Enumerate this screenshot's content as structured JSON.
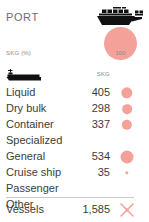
{
  "header": {
    "title": "PORT",
    "unit_label": "SKG (%)",
    "ship_icon": "cargo-ship-icon",
    "legend": {
      "value": "100",
      "bubble_color": "#f4a19a"
    }
  },
  "table": {
    "columns": {
      "category_icon": "tanker-boat-icon",
      "value_header": "SKG"
    },
    "rows": [
      {
        "label": "Liquid",
        "value": "405",
        "magnitude": 405
      },
      {
        "label": "Dry bulk",
        "value": "298",
        "magnitude": 298
      },
      {
        "label": "Container",
        "value": "337",
        "magnitude": 337
      },
      {
        "label": "Specialized",
        "value": "",
        "magnitude": 0
      },
      {
        "label": "General",
        "value": "534",
        "magnitude": 534
      },
      {
        "label": "Cruise ship",
        "value": "35",
        "magnitude": 35
      },
      {
        "label": "Passenger",
        "value": "",
        "magnitude": 0
      },
      {
        "label": "Other",
        "value": "",
        "magnitude": 0
      }
    ],
    "total": {
      "label": "Vessels",
      "value": "1,585",
      "mark": "x-mark-icon"
    }
  },
  "chart_data": {
    "type": "bar",
    "title": "PORT",
    "subtitle": "SKG (%)",
    "xlabel": "",
    "ylabel": "SKG",
    "categories": [
      "Liquid",
      "Dry bulk",
      "Container",
      "Specialized",
      "General",
      "Cruise ship",
      "Passenger",
      "Other"
    ],
    "values": [
      405,
      298,
      337,
      null,
      534,
      35,
      null,
      null
    ],
    "legend": [
      "100"
    ],
    "legend_position": "top-right",
    "grid": false,
    "annotations": [
      "Vessels 1,585"
    ],
    "encoding": "bubble-size proportional to SKG value",
    "accent_color": "#f4a19a",
    "total": 1585
  },
  "colors": {
    "accent": "#f4a19a",
    "text": "#3b3b3b",
    "muted": "#8a8a8a",
    "divider": "#c9c9c9",
    "icon": "#1a1a1a",
    "background": "#ffffff"
  }
}
